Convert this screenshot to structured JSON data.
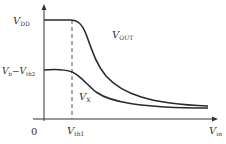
{
  "diagram": {
    "type": "voltage-transfer-curves",
    "axes": {
      "x_label": "V",
      "x_label_sub": "in",
      "origin_label": "0"
    },
    "y_levels": [
      {
        "label": "V",
        "label_sub": "DD"
      },
      {
        "label": "V",
        "label_sub": "b",
        "minus": "−V",
        "minus_sub": "th2"
      }
    ],
    "x_markers": [
      {
        "label": "V",
        "label_sub": "th1",
        "style": "dashed"
      }
    ],
    "curves": [
      {
        "name": "V",
        "name_sub": "OUT",
        "description": "starts at VDD, falls after Vth1, decays to near zero"
      },
      {
        "name": "V",
        "name_sub": "X",
        "description": "starts at Vb-Vth2, falls after Vth1, decays to near zero"
      }
    ],
    "colors": {
      "axis": "#333333",
      "curve": "#2a2a2a",
      "dashed": "#555555"
    }
  }
}
